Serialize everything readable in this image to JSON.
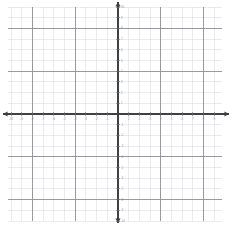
{
  "figure": {
    "kind": "cartesian-coordinate-grid",
    "width_px": 233,
    "height_px": 225,
    "background_color": "#ffffff",
    "title": "",
    "caption": ""
  },
  "chart_data": {
    "type": "scatter",
    "title": "",
    "subtitle": "",
    "xlabel": "",
    "ylabel": "",
    "xlim": [
      -10,
      10
    ],
    "ylim": [
      -10,
      10
    ],
    "grid": true,
    "minor_grid": true,
    "legend_position": "none",
    "series": [
      {
        "name": "",
        "x": [],
        "y": []
      }
    ],
    "annotations": [],
    "x_ticks": [
      -10,
      -9,
      -8,
      -7,
      -6,
      -5,
      -4,
      -3,
      -2,
      -1,
      1,
      2,
      3,
      4,
      5,
      6,
      7,
      8,
      9,
      10
    ],
    "y_ticks": [
      10,
      9,
      8,
      7,
      6,
      5,
      4,
      3,
      2,
      1,
      -1,
      -2,
      -3,
      -4,
      -5,
      -6,
      -7,
      -8,
      -9,
      -10
    ],
    "x_tick_labels": [
      "-10",
      "-9",
      "-8",
      "-7",
      "-6",
      "-5",
      "-4",
      "-3",
      "-2",
      "-1",
      "1",
      "2",
      "3",
      "4",
      "5",
      "6",
      "7",
      "8",
      "9",
      "10"
    ],
    "y_tick_labels": [
      "10",
      "9",
      "8",
      "7",
      "6",
      "5",
      "4",
      "3",
      "2",
      "1",
      "-1",
      "-2",
      "-3",
      "-4",
      "-5",
      "-6",
      "-7",
      "-8",
      "-9",
      "-10"
    ],
    "major_gridline_interval": 4,
    "minor_gridline_interval": 1
  },
  "geometry": {
    "origin_x_px": 118,
    "origin_y_px": 114,
    "cell_px": 10.7,
    "grid_left_px": 8,
    "grid_right_px": 222,
    "grid_top_px": 7,
    "grid_bottom_px": 221,
    "x_axis_start_px": 3,
    "x_axis_end_px": 229,
    "y_axis_start_px": 2,
    "y_axis_end_px": 223
  },
  "style": {
    "axis_color": "#3f3f46",
    "major_grid_color": "#8e8e96",
    "minor_grid_color": "#d8d8dd",
    "tick_color": "#6f6f77",
    "label_color": "#8a8a92",
    "axis_width_px": 1.6,
    "major_grid_width_px": 0.9,
    "minor_grid_width_px": 0.5,
    "label_font_size_px": 2.6
  },
  "icons": {
    "x_axis_arrow_left": "arrow-left-icon",
    "x_axis_arrow_right": "arrow-right-icon",
    "y_axis_arrow_up": "arrow-up-icon",
    "y_axis_arrow_down": "arrow-down-icon"
  }
}
